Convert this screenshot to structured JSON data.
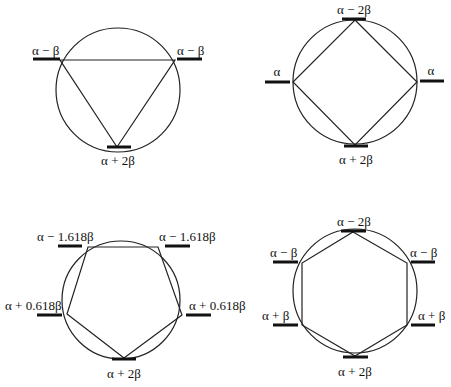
{
  "diagrams": [
    {
      "id": "triangle",
      "ring_size": 3,
      "center": [
        118,
        90
      ],
      "radius": 62,
      "vertices": [
        [
          60,
          60
        ],
        [
          175,
          60
        ],
        [
          117,
          147
        ]
      ],
      "levels": [
        {
          "label": "α − β",
          "bar": [
            33,
            59,
            60,
            59
          ],
          "text": [
            32,
            55
          ],
          "anchor": "start"
        },
        {
          "label": "α − β",
          "bar": [
            177,
            59,
            202,
            59
          ],
          "text": [
            177,
            55
          ],
          "anchor": "start"
        },
        {
          "label": "α + 2β",
          "bar": [
            107,
            147,
            131,
            147
          ],
          "text": [
            118,
            165
          ],
          "anchor": "middle"
        }
      ]
    },
    {
      "id": "square",
      "ring_size": 4,
      "center": [
        355,
        82
      ],
      "radius": 62,
      "vertices": [
        [
          355,
          20
        ],
        [
          417,
          82
        ],
        [
          355,
          145
        ],
        [
          293,
          82
        ]
      ],
      "levels": [
        {
          "label": "α − 2β",
          "bar": [
            342,
            19,
            366,
            19
          ],
          "text": [
            354,
            14
          ],
          "anchor": "middle"
        },
        {
          "label": "α",
          "bar": [
            265,
            82,
            290,
            82
          ],
          "text": [
            277,
            76
          ],
          "anchor": "middle"
        },
        {
          "label": "α",
          "bar": [
            420,
            81,
            444,
            81
          ],
          "text": [
            431,
            75
          ],
          "anchor": "middle"
        },
        {
          "label": "α + 2β",
          "bar": [
            344,
            146,
            368,
            146
          ],
          "text": [
            356,
            164
          ],
          "anchor": "middle"
        }
      ]
    },
    {
      "id": "pentagon",
      "ring_size": 5,
      "center": [
        121,
        300
      ],
      "radius": 59,
      "vertices": [
        [
          88,
          247
        ],
        [
          158,
          247
        ],
        [
          182,
          315
        ],
        [
          124,
          358
        ],
        [
          67,
          314
        ]
      ],
      "levels": [
        {
          "label": "α − 1.618β",
          "bar": [
            58,
            246,
            82,
            246
          ],
          "text": [
            37,
            241
          ],
          "anchor": "start"
        },
        {
          "label": "α − 1.618β",
          "bar": [
            165,
            246,
            190,
            246
          ],
          "text": [
            159,
            241
          ],
          "anchor": "start"
        },
        {
          "label": "α + 0.618β",
          "bar": [
            37,
            315,
            62,
            315
          ],
          "text": [
            5,
            310
          ],
          "anchor": "start"
        },
        {
          "label": "α + 0.618β",
          "bar": [
            186,
            315,
            211,
            315
          ],
          "text": [
            189,
            310
          ],
          "anchor": "start"
        },
        {
          "label": "α + 2β",
          "bar": [
            112,
            359,
            136,
            359
          ],
          "text": [
            124,
            378
          ],
          "anchor": "middle"
        }
      ]
    },
    {
      "id": "hexagon",
      "ring_size": 6,
      "center": [
        355,
        291
      ],
      "radius": 62,
      "vertices": [
        [
          353,
          232
        ],
        [
          407,
          263
        ],
        [
          407,
          325
        ],
        [
          355,
          356
        ],
        [
          302,
          325
        ],
        [
          302,
          263
        ]
      ],
      "levels": [
        {
          "label": "α − 2β",
          "bar": [
            341,
            231,
            366,
            231
          ],
          "text": [
            354,
            226
          ],
          "anchor": "middle"
        },
        {
          "label": "α − β",
          "bar": [
            273,
            262,
            298,
            262
          ],
          "text": [
            270,
            257
          ],
          "anchor": "start"
        },
        {
          "label": "α − β",
          "bar": [
            411,
            262,
            435,
            262
          ],
          "text": [
            410,
            257
          ],
          "anchor": "start"
        },
        {
          "label": "α + β",
          "bar": [
            273,
            325,
            298,
            325
          ],
          "text": [
            262,
            320
          ],
          "anchor": "start"
        },
        {
          "label": "α + β",
          "bar": [
            411,
            325,
            435,
            325
          ],
          "text": [
            418,
            320
          ],
          "anchor": "start"
        },
        {
          "label": "α + 2β",
          "bar": [
            343,
            357,
            368,
            357
          ],
          "text": [
            355,
            376
          ],
          "anchor": "middle"
        }
      ]
    }
  ]
}
